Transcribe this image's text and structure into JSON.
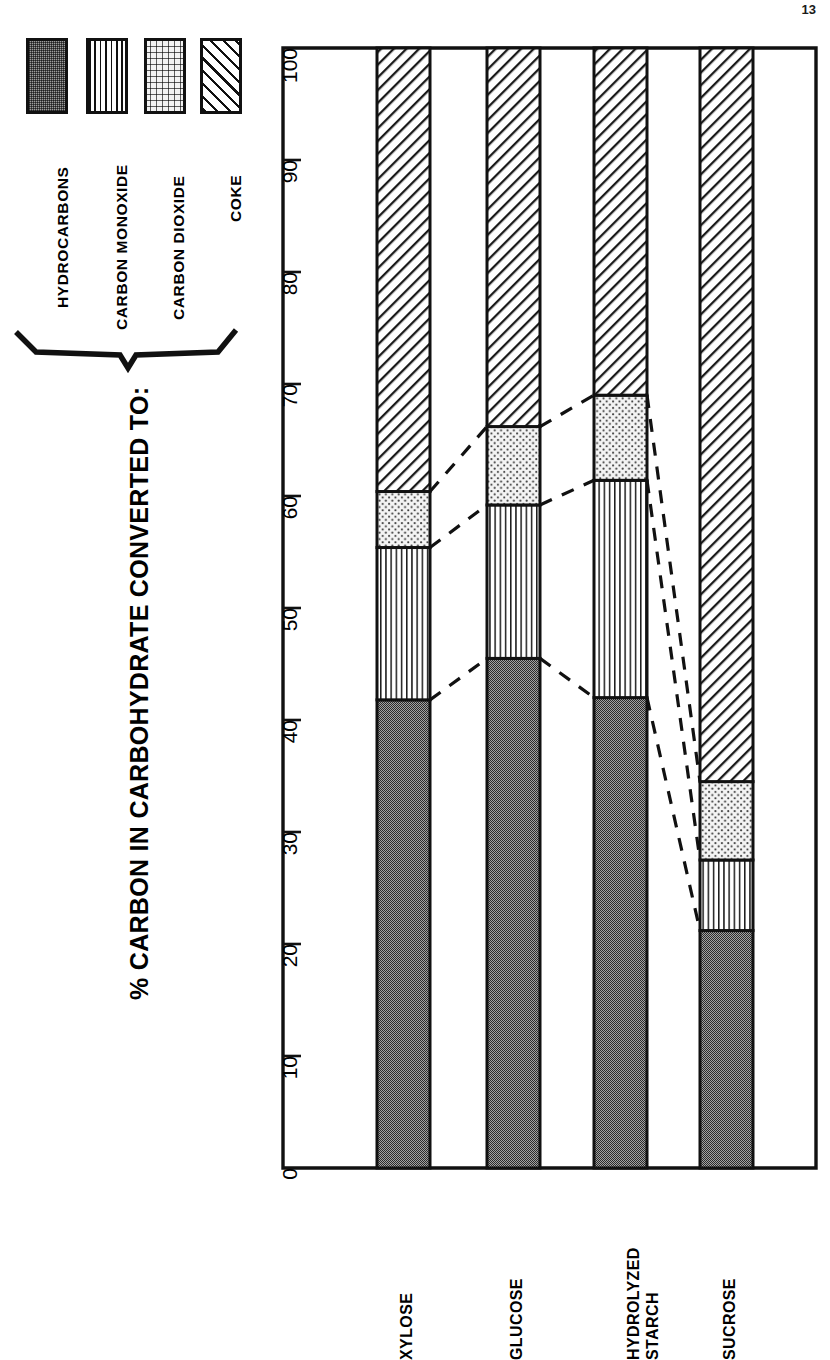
{
  "page_number": "13",
  "title": "% CARBON IN CARBOHYDRATE CONVERTED TO:",
  "legend": {
    "items": [
      {
        "label": "HYDROCARBONS",
        "pattern": "dense-gray-stipple",
        "icon": "swatch-icon"
      },
      {
        "label": "CARBON MONOXIDE",
        "pattern": "vertical-lines",
        "icon": "swatch-icon"
      },
      {
        "label": "CARBON DIOXIDE",
        "pattern": "sparse-dots",
        "icon": "swatch-icon"
      },
      {
        "label": "COKE",
        "pattern": "diagonal-hatch",
        "icon": "swatch-icon"
      }
    ],
    "bracket": "curly-brace-icon"
  },
  "axis": {
    "ticks": [
      "0",
      "10",
      "20",
      "30",
      "40",
      "50",
      "60",
      "70",
      "80",
      "90",
      "100"
    ]
  },
  "chart_data": {
    "type": "bar",
    "orientation": "vertical-stacked",
    "title": "% CARBON IN CARBOHYDRATE CONVERTED TO:",
    "xlabel": "",
    "ylabel": "% CARBON IN CARBOHYDRATE CONVERTED TO:",
    "ylim": [
      0,
      100
    ],
    "ytick_step": 10,
    "grid": false,
    "legend_position": "left",
    "stacked": true,
    "connectors": "dashed-lines-between-segment-boundaries",
    "categories": [
      "XYLOSE",
      "GLUCOSE",
      "HYDROLYZED STARCH",
      "SUCROSE"
    ],
    "category_lines": [
      [
        "XYLOSE"
      ],
      [
        "GLUCOSE"
      ],
      [
        "HYDROLYZED",
        "STARCH"
      ],
      [
        "SUCROSE"
      ]
    ],
    "series": [
      {
        "name": "HYDROCARBONS",
        "values": [
          41.8,
          45.5,
          42.0,
          21.2
        ]
      },
      {
        "name": "CARBON MONOXIDE",
        "values": [
          13.6,
          13.7,
          19.4,
          6.3
        ]
      },
      {
        "name": "CARBON DIOXIDE",
        "values": [
          5.0,
          7.0,
          7.6,
          7.0
        ]
      },
      {
        "name": "COKE",
        "values": [
          39.6,
          33.8,
          31.0,
          65.5
        ]
      }
    ],
    "cumulative": [
      {
        "category": "XYLOSE",
        "hydrocarbons": 41.8,
        "carbon_monoxide": 55.4,
        "carbon_dioxide": 60.4,
        "coke": 100
      },
      {
        "category": "GLUCOSE",
        "hydrocarbons": 45.5,
        "carbon_monoxide": 59.2,
        "carbon_dioxide": 66.2,
        "coke": 100
      },
      {
        "category": "HYDROLYZED STARCH",
        "hydrocarbons": 42.0,
        "carbon_monoxide": 61.4,
        "carbon_dioxide": 69.0,
        "coke": 100
      },
      {
        "category": "SUCROSE",
        "hydrocarbons": 21.2,
        "carbon_monoxide": 27.5,
        "carbon_dioxide": 34.5,
        "coke": 100
      }
    ]
  }
}
